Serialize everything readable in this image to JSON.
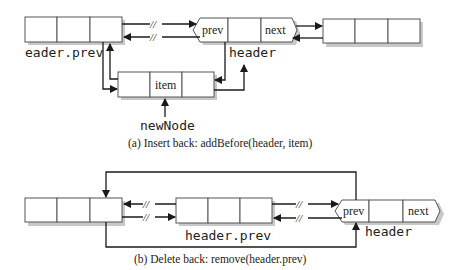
{
  "panel_a": {
    "caption": "(a) Insert back: addBefore(header, item)",
    "left_node_label": "eader.prev",
    "header_label": "header",
    "header_prev_field": "prev",
    "header_next_field": "next",
    "new_node_field": "item",
    "new_node_label": "newNode",
    "break_mark": "//"
  },
  "panel_b": {
    "caption": "(b) Delete back: remove(header.prev)",
    "middle_node_label": "header.prev",
    "header_label": "header",
    "header_prev_field": "prev",
    "header_next_field": "next",
    "break_mark": "//"
  }
}
